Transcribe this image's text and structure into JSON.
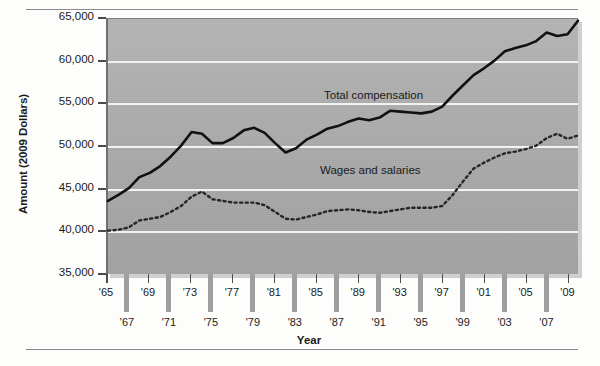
{
  "chart_data": {
    "type": "line",
    "title": "",
    "xlabel": "Year",
    "ylabel": "Amount (2009 Dollars)",
    "ylim": [
      35000,
      65000
    ],
    "yticks": [
      35000,
      40000,
      45000,
      50000,
      55000,
      60000,
      65000
    ],
    "ytick_labels": [
      "35,000",
      "40,000",
      "45,000",
      "50,000",
      "55,000",
      "60,000",
      "65,000"
    ],
    "grid": true,
    "legend_position": "inline-annotation",
    "xlim": [
      1965,
      2010
    ],
    "x": [
      1965,
      1966,
      1967,
      1968,
      1969,
      1970,
      1971,
      1972,
      1973,
      1974,
      1975,
      1976,
      1977,
      1978,
      1979,
      1980,
      1981,
      1982,
      1983,
      1984,
      1985,
      1986,
      1987,
      1988,
      1989,
      1990,
      1991,
      1992,
      1993,
      1994,
      1995,
      1996,
      1997,
      1998,
      1999,
      2000,
      2001,
      2002,
      2003,
      2004,
      2005,
      2006,
      2007,
      2008,
      2009,
      2010
    ],
    "xtick_labels_row1": [
      "'65",
      "'69",
      "'73",
      "'77",
      "'81",
      "'85",
      "'89",
      "'93",
      "'97",
      "'01",
      "'05",
      "'09"
    ],
    "xtick_labels_row2": [
      "'67",
      "'71",
      "'75",
      "'79",
      "'83",
      "'87",
      "'91",
      "'95",
      "'99",
      "'03",
      "'07"
    ],
    "series": [
      {
        "name": "Total compensation",
        "style": "solid",
        "color": "#111111",
        "values": [
          43600,
          44300,
          45100,
          46400,
          46900,
          47700,
          48800,
          50100,
          51700,
          51500,
          50400,
          50400,
          51000,
          51900,
          52200,
          51600,
          50400,
          49300,
          49800,
          50800,
          51400,
          52100,
          52400,
          52900,
          53300,
          53100,
          53400,
          54200,
          54100,
          54000,
          53900,
          54100,
          54700,
          56000,
          57200,
          58400,
          59200,
          60100,
          61200,
          61600,
          61900,
          62400,
          63400,
          63000,
          63200,
          64800
        ]
      },
      {
        "name": "Wages and salaries",
        "style": "dotted",
        "color": "#222222",
        "values": [
          40100,
          40200,
          40500,
          41300,
          41500,
          41700,
          42300,
          43000,
          44100,
          44700,
          43800,
          43600,
          43400,
          43400,
          43400,
          43100,
          42300,
          41500,
          41400,
          41700,
          42000,
          42400,
          42500,
          42600,
          42500,
          42300,
          42200,
          42400,
          42600,
          42800,
          42800,
          42800,
          43000,
          44300,
          45900,
          47400,
          48100,
          48700,
          49200,
          49400,
          49700,
          50100,
          51000,
          51500,
          50900,
          51300
        ]
      }
    ],
    "annotations": [
      {
        "text": "Total compensation",
        "near_year": 1988
      },
      {
        "text": "Wages and salaries",
        "near_year": 1988
      }
    ]
  },
  "axis": {
    "y_title": "Amount (2009 Dollars)",
    "x_title": "Year"
  }
}
